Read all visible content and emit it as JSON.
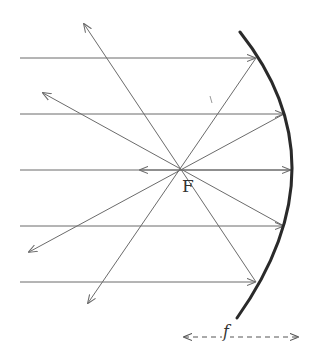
{
  "diagram": {
    "colors": {
      "ray": "#6b6b6b",
      "mirror": "#2a2a2a",
      "label": "#333333",
      "background": "#ffffff"
    },
    "focal_point": {
      "label": "F",
      "x": 183,
      "y": 170
    },
    "focal_length": {
      "label": "f",
      "y": 337,
      "x_start": 184,
      "x_end": 298
    },
    "mirror": {
      "type": "concave",
      "top": [
        240,
        32
      ],
      "vertex": [
        292,
        170
      ],
      "bottom": [
        237,
        318
      ]
    },
    "incident_rays": [
      {
        "y": 58,
        "x_start": 20,
        "x_hit": 256
      },
      {
        "y": 114,
        "x_start": 20,
        "x_hit": 284
      },
      {
        "y": 170,
        "x_start": 20,
        "x_hit": 291
      },
      {
        "y": 226,
        "x_start": 20,
        "x_hit": 284
      },
      {
        "y": 282,
        "x_start": 20,
        "x_hit": 256
      }
    ],
    "reflected_rays": [
      {
        "from": [
          256,
          58
        ],
        "to": [
          88,
          303
        ]
      },
      {
        "from": [
          284,
          114
        ],
        "to": [
          29,
          252
        ]
      },
      {
        "from": [
          291,
          170
        ],
        "to": [
          140,
          170
        ]
      },
      {
        "from": [
          284,
          226
        ],
        "to": [
          43,
          93
        ]
      },
      {
        "from": [
          256,
          282
        ],
        "to": [
          84,
          24
        ]
      }
    ],
    "stray_mark": {
      "x1": 210,
      "y1": 96,
      "x2": 212,
      "y2": 103
    }
  }
}
